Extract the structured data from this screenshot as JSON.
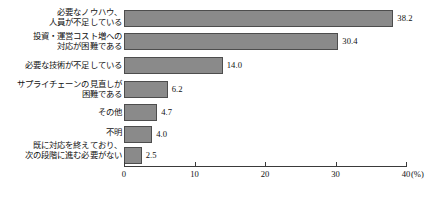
{
  "chart_data": {
    "type": "bar",
    "orientation": "horizontal",
    "title": "",
    "xlabel": "(%)",
    "ylabel": "",
    "xlim": [
      0,
      40
    ],
    "xticks": [
      0,
      10,
      20,
      30,
      40
    ],
    "xtick_labels": [
      "0",
      "10",
      "20",
      "30",
      "40"
    ],
    "grid": false,
    "legend": false,
    "categories": [
      "必要なノウハウ、\n人員が不足している",
      "投資・運営コスト増への\n対応が困難である",
      "必要な技術が不足している",
      "サプライチェーンの見直しが\n困難である",
      "その他",
      "不明",
      "既に対応を終えており、\n次の段階に進む必要がない"
    ],
    "values": [
      38.2,
      30.4,
      14.0,
      6.2,
      4.7,
      4.0,
      2.5
    ],
    "value_labels": [
      "38.2",
      "30.4",
      "14.0",
      "6.2",
      "4.7",
      "4.0",
      "2.5"
    ],
    "bar_fill_color": "#8a8a8a",
    "bar_border_color": "#4d4d4d",
    "axis_color": "#3a3a3a",
    "background_color": "#ffffff"
  },
  "axis": {
    "unit_label": "(%)"
  }
}
